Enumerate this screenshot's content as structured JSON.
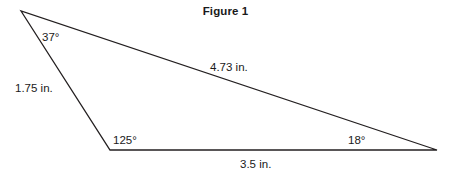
{
  "figure": {
    "title": "Figure 1",
    "background_color": "#ffffff",
    "stroke_color": "#231f20",
    "text_color": "#1a1a1a",
    "width": 451,
    "height": 178
  },
  "chart_data": {
    "type": "diagram",
    "shape": "triangle",
    "title": "Figure 1",
    "xlabel": "",
    "ylabel": "",
    "grid": false,
    "legend": "none",
    "unit": "in.",
    "vertices": [
      {
        "id": "A",
        "x": 21,
        "y": 11,
        "angle": "37°",
        "angle_value": 37
      },
      {
        "id": "B",
        "x": 110,
        "y": 150,
        "angle": "125°",
        "angle_value": 125
      },
      {
        "id": "C",
        "x": 437,
        "y": 150,
        "angle": "18°",
        "angle_value": 18
      }
    ],
    "sides": [
      {
        "id": "AB",
        "from": "A",
        "to": "B",
        "label": "1.75 in.",
        "length_value": 1.75
      },
      {
        "id": "AC",
        "from": "A",
        "to": "C",
        "label": "4.73 in.",
        "length_value": 4.73
      },
      {
        "id": "BC",
        "from": "B",
        "to": "C",
        "label": "3.5 in.",
        "length_value": 3.5
      }
    ],
    "angle_sum": 180
  },
  "labels": {
    "angle_top": "37°",
    "angle_bottom_left": "125°",
    "angle_right": "18°",
    "side_left": "1.75 in.",
    "side_top": "4.73 in.",
    "side_bottom": "3.5 in."
  }
}
